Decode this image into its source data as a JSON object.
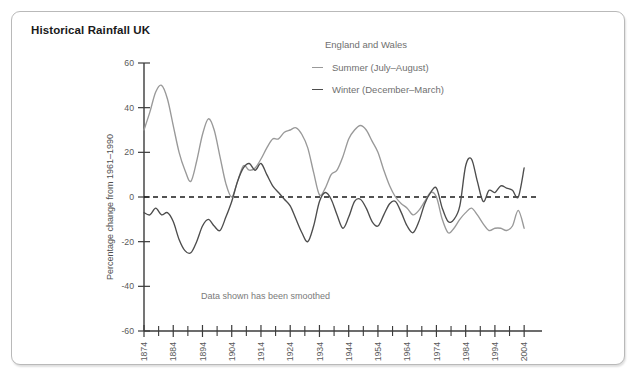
{
  "panel": {
    "title": "Historical Rainfall UK"
  },
  "legend": {
    "title": "England and Wales",
    "entries": [
      {
        "label": "Summer (July–August)",
        "color": "#999999",
        "key": "summer"
      },
      {
        "label": "Winter (December–March)",
        "color": "#4d4d4d",
        "key": "winter"
      }
    ]
  },
  "note": "Data shown has been smoothed",
  "chart_data": {
    "type": "line",
    "title": "Historical Rainfall UK",
    "subtitle": "England and Wales",
    "xlabel": "",
    "ylabel": "Percentage change from 1961–1990",
    "xlim": [
      1874,
      2006
    ],
    "ylim": [
      -60,
      60
    ],
    "yticks": [
      60,
      40,
      20,
      0,
      -20,
      -40,
      -60
    ],
    "xticks_labeled": [
      1874,
      1884,
      1894,
      1904,
      1914,
      1924,
      1934,
      1944,
      1954,
      1964,
      1974,
      1984,
      1994,
      2004
    ],
    "xtick_minor_step": 5,
    "grid": false,
    "zero_reference_line": 0,
    "legend_position": "top-right",
    "annotations": [
      "Data shown has been smoothed"
    ],
    "x": [
      1874,
      1876,
      1878,
      1880,
      1882,
      1884,
      1886,
      1888,
      1890,
      1892,
      1894,
      1896,
      1898,
      1900,
      1902,
      1904,
      1906,
      1908,
      1910,
      1912,
      1914,
      1916,
      1918,
      1920,
      1922,
      1924,
      1926,
      1928,
      1930,
      1932,
      1934,
      1936,
      1938,
      1940,
      1942,
      1944,
      1946,
      1948,
      1950,
      1952,
      1954,
      1956,
      1958,
      1960,
      1962,
      1964,
      1966,
      1968,
      1970,
      1972,
      1974,
      1976,
      1978,
      1980,
      1982,
      1984,
      1986,
      1988,
      1990,
      1992,
      1994,
      1996,
      1998,
      2000,
      2002,
      2004
    ],
    "series": [
      {
        "name": "Summer (July–August)",
        "color": "#999999",
        "values": [
          30,
          38,
          47,
          50,
          44,
          32,
          20,
          12,
          7,
          16,
          28,
          35,
          30,
          18,
          6,
          0,
          7,
          14,
          12,
          13,
          17,
          22,
          26,
          26,
          29,
          30,
          31,
          28,
          22,
          11,
          1,
          4,
          10,
          12,
          18,
          26,
          30,
          32,
          30,
          25,
          20,
          12,
          5,
          0,
          -3,
          -5,
          -8,
          -6,
          -2,
          2,
          0,
          -10,
          -16,
          -14,
          -10,
          -7,
          -5,
          -8,
          -12,
          -15,
          -14,
          -14,
          -15,
          -13,
          -6,
          -14
        ]
      },
      {
        "name": "Winter (December–March)",
        "color": "#4d4d4d",
        "values": [
          -7,
          -8,
          -5,
          -8,
          -7,
          -11,
          -19,
          -24,
          -25,
          -20,
          -13,
          -10,
          -13,
          -15,
          -9,
          -2,
          7,
          13,
          15,
          12,
          15,
          10,
          5,
          2,
          -1,
          -4,
          -10,
          -16,
          -20,
          -13,
          -2,
          2,
          -1,
          -8,
          -14,
          -9,
          -2,
          -1,
          -5,
          -11,
          -13,
          -8,
          -3,
          -2,
          -7,
          -13,
          -16,
          -11,
          -3,
          2,
          4,
          -5,
          -11,
          -10,
          -4,
          14,
          17,
          7,
          -2,
          3,
          2,
          5,
          4,
          3,
          0,
          13
        ]
      }
    ]
  }
}
